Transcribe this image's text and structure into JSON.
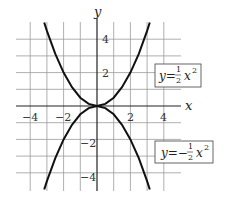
{
  "chart_data": {
    "type": "line",
    "title": "",
    "xlabel": "x",
    "ylabel": "y",
    "xlim": [
      -5,
      5
    ],
    "ylim": [
      -5,
      5
    ],
    "grid": true,
    "x_ticks": [
      -4,
      -2,
      2,
      4
    ],
    "y_ticks": [
      4,
      2,
      -2,
      -4
    ],
    "x_tick_labels": [
      "−4",
      "−2",
      "2",
      "4"
    ],
    "y_tick_labels": [
      "4",
      "2",
      "−2",
      "−4"
    ],
    "series": [
      {
        "name": "y = 1/2 x^2",
        "label_prefix": "y=",
        "label_num": "1",
        "label_den": "2",
        "label_var": "x",
        "label_exp": "2",
        "x": [
          -3.16,
          -3,
          -2.5,
          -2,
          -1.5,
          -1,
          -0.5,
          0,
          0.5,
          1,
          1.5,
          2,
          2.5,
          3,
          3.16
        ],
        "y": [
          5,
          4.5,
          3.125,
          2,
          1.125,
          0.5,
          0.125,
          0,
          0.125,
          0.5,
          1.125,
          2,
          3.125,
          4.5,
          5
        ]
      },
      {
        "name": "y = -1/2 x^2",
        "label_prefix": "y=−",
        "label_num": "1",
        "label_den": "2",
        "label_var": "x",
        "label_exp": "2",
        "x": [
          -3.16,
          -3,
          -2.5,
          -2,
          -1.5,
          -1,
          -0.5,
          0,
          0.5,
          1,
          1.5,
          2,
          2.5,
          3,
          3.16
        ],
        "y": [
          -5,
          -4.5,
          -3.125,
          -2,
          -1.125,
          -0.5,
          -0.125,
          0,
          -0.125,
          -0.5,
          -1.125,
          -2,
          -3.125,
          -4.5,
          -5
        ]
      }
    ],
    "annotations": [
      "y = 1/2 x^2",
      "y = -1/2 x^2"
    ]
  }
}
